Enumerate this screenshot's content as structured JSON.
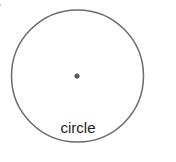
{
  "diagram": {
    "shape": {
      "type": "circle",
      "label": "circle",
      "stroke_color": "#6b6b6b",
      "center_dot_color": "#5a5a5a"
    }
  }
}
